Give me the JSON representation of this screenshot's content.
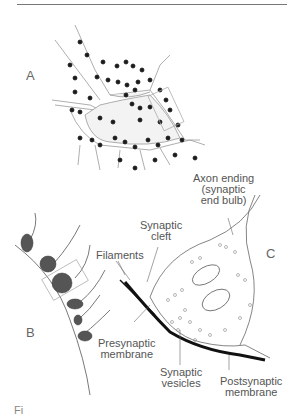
{
  "figure": {
    "panels": {
      "a": "A",
      "b": "B",
      "c": "C"
    },
    "labels": {
      "axon_ending_line1": "Axon ending",
      "axon_ending_line2": "(synaptic",
      "axon_ending_line3": "end bulb)",
      "synaptic_cleft_line1": "Synaptic",
      "synaptic_cleft_line2": "cleft",
      "filaments": "Filaments",
      "presynaptic_line1": "Presynaptic",
      "presynaptic_line2": "membrane",
      "vesicles_line1": "Synaptic",
      "vesicles_line2": "vesicles",
      "postsynaptic_line1": "Postsynaptic",
      "postsynaptic_line2": "membrane"
    },
    "caption": "Fi"
  },
  "colors": {
    "ink": "#1a1a1a",
    "line": "#666666",
    "text": "#555555"
  }
}
